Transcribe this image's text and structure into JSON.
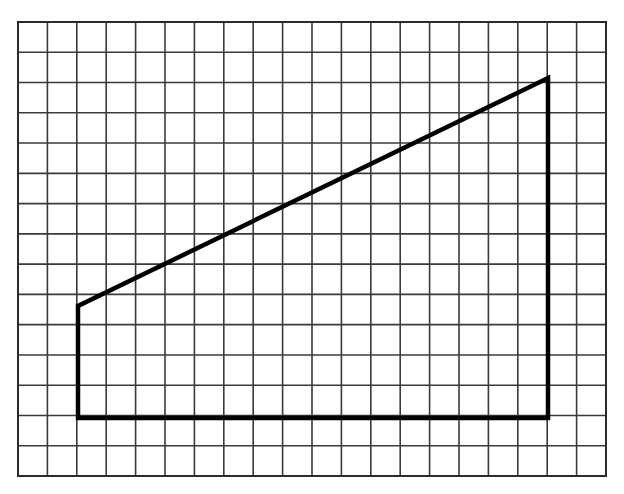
{
  "document": {
    "title": "Graph paper figure — right trapezoid",
    "background_color": "#ffffff",
    "width": 624,
    "height": 494
  },
  "grid": {
    "name": "graph-paper-grid",
    "origin_x": 18,
    "origin_y": 22,
    "cell_width": 29.4,
    "cell_height": 30.2667,
    "columns": 20,
    "rows": 15,
    "right_x": 606,
    "bottom_y": 476,
    "line_color": "#3a3a3a",
    "line_width": 1.6,
    "border_color": "#2b2b2b",
    "border_width": 2
  },
  "chart_data": {
    "type": "scatter",
    "subtitle": "",
    "xlabel": "",
    "ylabel": "",
    "grid": "on",
    "legend_position": "none",
    "xlim": [
      0,
      20
    ],
    "ylim": [
      0,
      15
    ],
    "xticks": [
      0,
      1,
      2,
      3,
      4,
      5,
      6,
      7,
      8,
      9,
      10,
      11,
      12,
      13,
      14,
      15,
      16,
      17,
      18,
      19,
      20
    ],
    "yticks": [
      0,
      1,
      2,
      3,
      4,
      5,
      6,
      7,
      8,
      9,
      10,
      11,
      12,
      13,
      14,
      15
    ],
    "xtick_labels": [],
    "ytick_labels": [],
    "annotations": [],
    "series": [
      {
        "name": "trapezoid-outline",
        "shape": "closed-polygon",
        "stroke_color": "#000000",
        "stroke_width": 4.5,
        "fill": "none",
        "vertices_grid_units": [
          {
            "label": "bottom-left",
            "x": 2,
            "y": 2
          },
          {
            "label": "top-left",
            "x": 2,
            "y": 5.6
          },
          {
            "label": "top-right",
            "x": 18,
            "y": 13.15
          },
          {
            "label": "bottom-right",
            "x": 18,
            "y": 2
          }
        ],
        "vertices_pixels": [
          {
            "label": "bottom-left",
            "x": 78,
            "y": 418
          },
          {
            "label": "top-left",
            "x": 78,
            "y": 306
          },
          {
            "label": "top-right",
            "x": 548,
            "y": 78
          },
          {
            "label": "bottom-right",
            "x": 548,
            "y": 418
          }
        ],
        "edges": [
          {
            "name": "left-vertical-edge",
            "from": "bottom-left",
            "to": "top-left",
            "length_grid_units": 3.6
          },
          {
            "name": "slanted-top-edge",
            "from": "top-left",
            "to": "top-right",
            "length_grid_units": 17.7
          },
          {
            "name": "right-vertical-edge",
            "from": "top-right",
            "to": "bottom-right",
            "length_grid_units": 11.15
          },
          {
            "name": "bottom-horizontal-edge",
            "from": "bottom-right",
            "to": "bottom-left",
            "length_grid_units": 16
          }
        ]
      }
    ]
  }
}
